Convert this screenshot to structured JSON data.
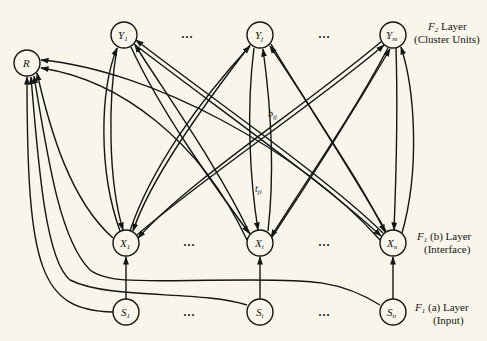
{
  "diagram": {
    "background": "#f8f5ea",
    "stroke": "#151515",
    "nodes": {
      "R": {
        "label": "R",
        "sub": ""
      },
      "Y1": {
        "label": "Y",
        "sub": "1"
      },
      "Yj": {
        "label": "Y",
        "sub": "j"
      },
      "Ym": {
        "label": "Y",
        "sub": "m"
      },
      "X1": {
        "label": "X",
        "sub": "1"
      },
      "Xi": {
        "label": "X",
        "sub": "i"
      },
      "Xn": {
        "label": "X",
        "sub": "n"
      },
      "S1": {
        "label": "S",
        "sub": "1"
      },
      "Si": {
        "label": "S",
        "sub": "i"
      },
      "Sn": {
        "label": "S",
        "sub": "n"
      }
    },
    "ellipsis": "…",
    "weights": {
      "bottom_up": {
        "base": "b",
        "sub": "ij"
      },
      "top_down": {
        "base": "t",
        "sub": "ji"
      }
    },
    "layers": {
      "f2": {
        "name_base": "F",
        "name_sub": "2",
        "name_rest": " Layer",
        "desc": "(Cluster Units)"
      },
      "f1b": {
        "name_base": "F",
        "name_sub": "1",
        "name_mid": " (b)",
        "name_rest": " Layer",
        "desc": "(Interface)"
      },
      "f1a": {
        "name_base": "F",
        "name_sub": "1",
        "name_mid": " (a)",
        "name_rest": " Layer",
        "desc": "(Input)"
      }
    }
  }
}
